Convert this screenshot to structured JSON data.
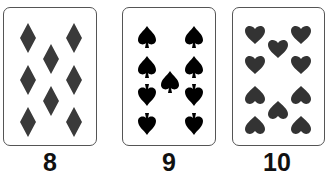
{
  "cards": [
    {
      "rank_label": "8",
      "suit": "diamonds",
      "pip_count": 8,
      "pip_color": "#3a3a3a"
    },
    {
      "rank_label": "9",
      "suit": "spades",
      "pip_count": 9,
      "pip_color": "#000000"
    },
    {
      "rank_label": "10",
      "suit": "hearts",
      "pip_count": 10,
      "pip_color": "#333333"
    }
  ]
}
